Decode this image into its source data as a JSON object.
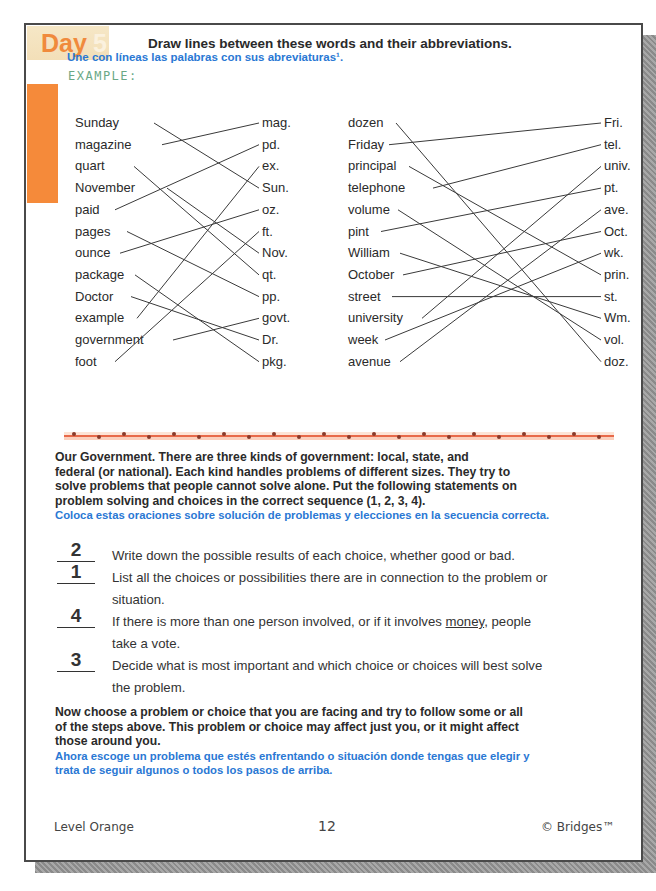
{
  "header": {
    "day_label": "Day",
    "day_number": "5",
    "instruction_en": "Draw lines between these words and their abbreviations.",
    "instruction_es": "Une con líneas las palabras con sus abreviaturas¹.",
    "example_label": "EXAMPLE:"
  },
  "matching": {
    "left_words": [
      "Sunday",
      "magazine",
      "quart",
      "November",
      "paid",
      "pages",
      "ounce",
      "package",
      "Doctor",
      "example",
      "government",
      "foot"
    ],
    "left_abbrevs": [
      "mag.",
      "pd.",
      "ex.",
      "Sun.",
      "oz.",
      "ft.",
      "Nov.",
      "qt.",
      "pp.",
      "govt.",
      "Dr.",
      "pkg."
    ],
    "right_words": [
      "dozen",
      "Friday",
      "principal",
      "telephone",
      "volume",
      "pint",
      "William",
      "October",
      "street",
      "university",
      "week",
      "avenue"
    ],
    "right_abbrevs": [
      "Fri.",
      "tel.",
      "univ.",
      "pt.",
      "ave.",
      "Oct.",
      "wk.",
      "prin.",
      "st.",
      "Wm.",
      "vol.",
      "doz."
    ],
    "left_pairs": [
      [
        0,
        3
      ],
      [
        1,
        0
      ],
      [
        2,
        7
      ],
      [
        3,
        6
      ],
      [
        4,
        1
      ],
      [
        5,
        8
      ],
      [
        6,
        4
      ],
      [
        7,
        11
      ],
      [
        8,
        10
      ],
      [
        9,
        2
      ],
      [
        10,
        9
      ],
      [
        11,
        5
      ]
    ],
    "right_pairs": [
      [
        0,
        11
      ],
      [
        1,
        0
      ],
      [
        2,
        7
      ],
      [
        3,
        1
      ],
      [
        4,
        10
      ],
      [
        5,
        3
      ],
      [
        6,
        9
      ],
      [
        7,
        5
      ],
      [
        8,
        8
      ],
      [
        9,
        2
      ],
      [
        10,
        6
      ],
      [
        11,
        4
      ]
    ]
  },
  "section2": {
    "intro_en": "Our Government. There are three kinds of government: local, state, and federal (or national). Each kind handles problems of different sizes. They try to solve problems that people cannot solve alone. Put the following statements on problem solving and choices in the correct sequence (1, 2, 3, 4).",
    "intro_lines": [
      "Our Government. There are three kinds of government: local, state, and",
      "federal (or national). Each kind handles problems of different sizes. They try to",
      "solve problems that people cannot solve alone. Put the following statements on",
      "problem solving and choices in the correct sequence (1, 2, 3, 4)."
    ],
    "intro_es": "Coloca estas oraciones sobre solución de problemas y elecciones en la secuencia correcta.",
    "steps": [
      {
        "answer": "2",
        "lines": [
          "Write down the possible results of each choice, whether good or bad."
        ]
      },
      {
        "answer": "1",
        "lines": [
          "List all the choices or possibilities there are in connection to the problem or",
          "situation."
        ]
      },
      {
        "answer": "4",
        "pre": "If there is more than one person involved, or if it involves ",
        "underlined": "money",
        "post": ", people",
        "line2": "take a vote."
      },
      {
        "answer": "3",
        "lines": [
          "Decide what is most important and which choice or choices will best solve",
          "the problem."
        ]
      }
    ],
    "closing_lines": [
      "Now choose a problem or choice that you are facing and try to follow some or all",
      "of the steps above. This problem or choice may affect just you, or it might affect",
      "those around you."
    ],
    "closing_es_lines": [
      "Ahora escoge un problema que estés enfrentando o situación donde tengas que elegir y",
      "trata de seguir algunos o todos los pasos de arriba."
    ]
  },
  "footer": {
    "level": "Level Orange",
    "page_number": "12",
    "copyright": "© Bridges™"
  },
  "colors": {
    "accent_orange": "#f58a3a",
    "spanish_blue": "#2a78d4",
    "example_green": "#6aa886"
  }
}
